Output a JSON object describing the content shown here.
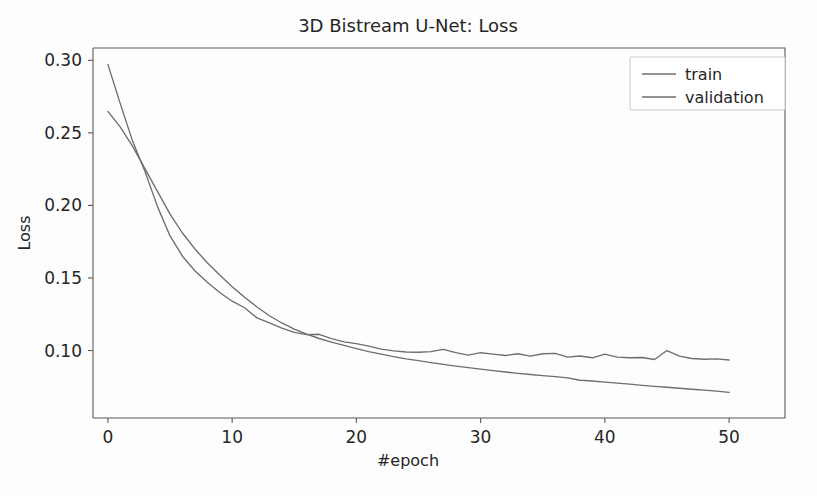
{
  "figure": {
    "background_color": "#fdfdfd",
    "width": 817,
    "height": 496
  },
  "chart_data": {
    "type": "line",
    "title": "3D Bistream U-Net: Loss",
    "xlabel": "#epoch",
    "ylabel": "Loss",
    "xlim": [
      -1.2,
      54.5
    ],
    "ylim": [
      0.0535,
      0.3085
    ],
    "xticks": [
      0,
      10,
      20,
      30,
      40,
      50
    ],
    "xtick_labels": [
      "0",
      "10",
      "20",
      "30",
      "40",
      "50"
    ],
    "yticks": [
      0.1,
      0.15,
      0.2,
      0.25,
      0.3
    ],
    "ytick_labels": [
      "0.10",
      "0.15",
      "0.20",
      "0.25",
      "0.30"
    ],
    "grid": false,
    "legend_position": "upper right",
    "x": [
      0,
      1,
      2,
      3,
      4,
      5,
      6,
      7,
      8,
      9,
      10,
      11,
      12,
      13,
      14,
      15,
      16,
      17,
      18,
      19,
      20,
      21,
      22,
      23,
      24,
      25,
      26,
      27,
      28,
      29,
      30,
      31,
      32,
      33,
      34,
      35,
      36,
      37,
      38,
      39,
      40,
      41,
      42,
      43,
      44,
      45,
      46,
      47,
      48,
      49,
      50
    ],
    "series": [
      {
        "name": "train",
        "color": "#6e6e6e",
        "values": [
          0.2648,
          0.254,
          0.2405,
          0.225,
          0.2095,
          0.194,
          0.181,
          0.17,
          0.1605,
          0.152,
          0.144,
          0.1367,
          0.13,
          0.124,
          0.119,
          0.1148,
          0.1113,
          0.1083,
          0.1058,
          0.1035,
          0.1013,
          0.0993,
          0.0975,
          0.0958,
          0.0943,
          0.093,
          0.0917,
          0.0905,
          0.0893,
          0.0882,
          0.0872,
          0.0862,
          0.0852,
          0.0843,
          0.0835,
          0.0827,
          0.082,
          0.0812,
          0.0795,
          0.079,
          0.0782,
          0.0775,
          0.0768,
          0.076,
          0.0753,
          0.0747,
          0.074,
          0.0733,
          0.0727,
          0.072,
          0.0712
        ]
      },
      {
        "name": "validation",
        "color": "#6e6e6e",
        "values": [
          0.2972,
          0.27,
          0.244,
          0.223,
          0.199,
          0.179,
          0.165,
          0.155,
          0.147,
          0.14,
          0.134,
          0.1295,
          0.1225,
          0.119,
          0.1155,
          0.1125,
          0.111,
          0.1112,
          0.1082,
          0.106,
          0.1048,
          0.103,
          0.101,
          0.0998,
          0.099,
          0.0988,
          0.0993,
          0.1008,
          0.0985,
          0.0968,
          0.0985,
          0.0975,
          0.0966,
          0.0978,
          0.0962,
          0.0978,
          0.098,
          0.0955,
          0.0962,
          0.095,
          0.0975,
          0.0955,
          0.095,
          0.0952,
          0.0938,
          0.1,
          0.0962,
          0.0945,
          0.094,
          0.0942,
          0.0935
        ]
      }
    ]
  },
  "legend": {
    "entries": [
      {
        "label": "train"
      },
      {
        "label": "validation"
      }
    ]
  }
}
